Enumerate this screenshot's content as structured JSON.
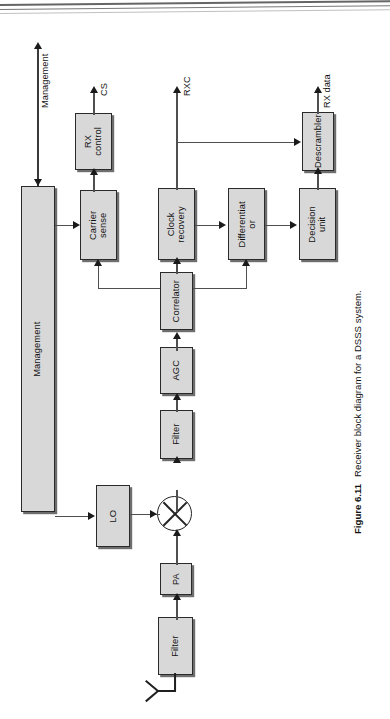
{
  "figure": {
    "number": "Figure 6.11",
    "caption": "Receiver block diagram for a DSSS system.",
    "orientation": "rotated-90-ccw",
    "page_type": "scanned-book-page"
  },
  "diagram": {
    "type": "block-diagram",
    "title": "Receiver block diagram for a DSSS system",
    "blocks": [
      {
        "id": "management",
        "label": "Management"
      },
      {
        "id": "rx-control",
        "label": "RX\ncontrol",
        "line1": "RX",
        "line2": "control"
      },
      {
        "id": "carrier-sense",
        "label": "Carrier\nsense",
        "line1": "Carrier",
        "line2": "sense"
      },
      {
        "id": "clock-recovery",
        "label": "Clock\nrecovery",
        "line1": "Clock",
        "line2": "recovery"
      },
      {
        "id": "differentiator",
        "label": "Differentiat\nor",
        "line1": "Differentiat",
        "line2": "or"
      },
      {
        "id": "decision-unit",
        "label": "Decision\nunit",
        "line1": "Decision",
        "line2": "unit"
      },
      {
        "id": "descrambler",
        "label": "Descrambler"
      },
      {
        "id": "correlator",
        "label": "Correlator"
      },
      {
        "id": "agc",
        "label": "AGC"
      },
      {
        "id": "filter-if",
        "label": "Filter"
      },
      {
        "id": "lo",
        "label": "LO"
      },
      {
        "id": "pa",
        "label": "PA"
      },
      {
        "id": "filter-rf",
        "label": "Filter"
      }
    ],
    "signal_labels": [
      {
        "id": "management-port",
        "label": "Management"
      },
      {
        "id": "cs-out",
        "label": "CS"
      },
      {
        "id": "rxc-out",
        "label": "RXC"
      },
      {
        "id": "rx-data-out",
        "label": "RX data"
      }
    ],
    "symbols": [
      {
        "id": "mixer",
        "label": "mixer-multiplier"
      },
      {
        "id": "antenna",
        "label": "antenna"
      }
    ],
    "colors": {
      "block_fill": "#d8d8d8",
      "block_border": "#2a2a2a",
      "block_shadow": "#6e6e6e",
      "line": "#4f4f4f",
      "arrowhead": "#1a1a1a",
      "page_background": "#ffffff",
      "text": "#111111"
    }
  }
}
